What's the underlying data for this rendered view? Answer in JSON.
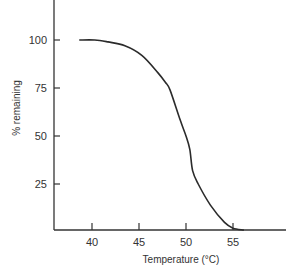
{
  "chart_data": {
    "type": "line",
    "title": "",
    "xlabel": "Temperature (°C)",
    "ylabel": "% remaining",
    "xlim": [
      35.5,
      61.5
    ],
    "ylim": [
      0,
      120
    ],
    "x_ticks": [
      40,
      45,
      50,
      55
    ],
    "y_ticks": [
      25,
      50,
      75,
      100
    ],
    "grid": false,
    "legend": null,
    "series": [
      {
        "name": "% remaining",
        "x": [
          38.7,
          40.3,
          41.7,
          43.5,
          45.3,
          47.0,
          47.8,
          48.3,
          49.4,
          50.0,
          50.4,
          50.7,
          51.3,
          52.6,
          54.1,
          55.0,
          56.1
        ],
        "y": [
          100,
          100,
          99,
          97,
          92,
          83,
          78,
          74,
          58,
          50,
          43,
          32,
          25,
          14,
          5,
          2,
          0.5
        ]
      }
    ],
    "colors": {
      "line": "#2b2b2b",
      "axis": "#333333"
    }
  }
}
